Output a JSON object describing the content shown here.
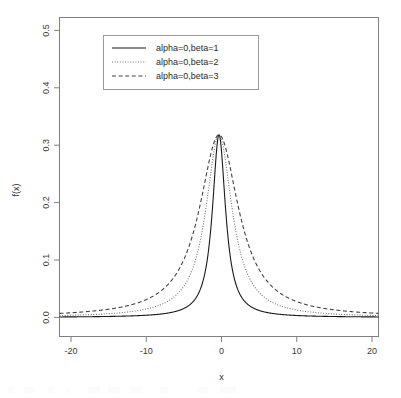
{
  "chart_data": {
    "type": "line",
    "title": "",
    "xlabel": "x",
    "ylabel": "f(x)",
    "xlim": [
      -20,
      20
    ],
    "ylim": [
      0.0,
      0.53
    ],
    "xticks": [
      -20,
      -10,
      0,
      10,
      20
    ],
    "xtick_labels": [
      "-20",
      "-10",
      "0",
      "10",
      "20"
    ],
    "yticks": [
      0.0,
      0.1,
      0.2,
      0.3,
      0.4,
      0.5
    ],
    "ytick_labels": [
      "0.0",
      "0.1",
      "0.2",
      "0.3",
      "0.4",
      "0.5"
    ],
    "grid": false,
    "legend_position": "top-center",
    "peak_value": 0.318,
    "series": [
      {
        "name": "alpha=0,beta=1",
        "alpha": 0,
        "beta": 1,
        "linestyle": "solid",
        "color": "#1a1a1a",
        "x": [
          -20,
          -18,
          -16,
          -14,
          -12,
          -10,
          -9,
          -8,
          -7,
          -6,
          -5,
          -4,
          -3.5,
          -3,
          -2.5,
          -2,
          -1.75,
          -1.5,
          -1.25,
          -1,
          -0.75,
          -0.5,
          -0.25,
          0,
          0.25,
          0.5,
          0.75,
          1,
          1.25,
          1.5,
          1.75,
          2,
          2.5,
          3,
          3.5,
          4,
          5,
          6,
          7,
          8,
          9,
          10,
          12,
          14,
          16,
          18,
          20
        ],
        "y": [
          0.0008,
          0.001,
          0.0012,
          0.0016,
          0.0022,
          0.0032,
          0.0039,
          0.0049,
          0.0064,
          0.0086,
          0.0122,
          0.0187,
          0.024,
          0.0318,
          0.0439,
          0.0637,
          0.078,
          0.0979,
          0.1252,
          0.1592,
          0.2037,
          0.2546,
          0.2995,
          0.3183,
          0.2995,
          0.2546,
          0.2037,
          0.1592,
          0.1252,
          0.0979,
          0.078,
          0.0637,
          0.0439,
          0.0318,
          0.024,
          0.0187,
          0.0122,
          0.0086,
          0.0064,
          0.0049,
          0.0039,
          0.0032,
          0.0022,
          0.0016,
          0.0012,
          0.001,
          0.0008
        ]
      },
      {
        "name": "alpha=0,beta=2",
        "alpha": 0,
        "beta": 2,
        "linestyle": "dotted",
        "color": "#777777",
        "x": [
          -20,
          -18,
          -16,
          -14,
          -12,
          -10,
          -9,
          -8,
          -7,
          -6,
          -5,
          -4,
          -3.5,
          -3,
          -2.5,
          -2,
          -1.5,
          -1,
          -0.75,
          -0.5,
          -0.25,
          0,
          0.25,
          0.5,
          0.75,
          1,
          1.5,
          2,
          2.5,
          3,
          3.5,
          4,
          5,
          6,
          7,
          8,
          9,
          10,
          12,
          14,
          16,
          18,
          20
        ],
        "y": [
          0.003,
          0.0037,
          0.0047,
          0.0061,
          0.0082,
          0.0117,
          0.014,
          0.0171,
          0.0214,
          0.0273,
          0.0357,
          0.0473,
          0.0542,
          0.062,
          0.0704,
          0.079,
          0.0947,
          0.1063,
          0.1093,
          0.1111,
          0.1116,
          0.1117,
          0.1116,
          0.1111,
          0.1093,
          0.1063,
          0.0947,
          0.079,
          0.0704,
          0.062,
          0.0542,
          0.0473,
          0.0357,
          0.0273,
          0.0214,
          0.0171,
          0.014,
          0.0117,
          0.0082,
          0.0061,
          0.0047,
          0.0037,
          0.003
        ]
      },
      {
        "name": "alpha=0,beta=3",
        "alpha": 0,
        "beta": 3,
        "linestyle": "dashed",
        "color": "#444444",
        "x": [
          -20,
          -18,
          -16,
          -14,
          -12,
          -10,
          -9,
          -8,
          -7,
          -6,
          -5,
          -4,
          -3,
          -2,
          -1,
          -0.5,
          0,
          0.5,
          1,
          2,
          3,
          4,
          5,
          6,
          7,
          8,
          9,
          10,
          12,
          14,
          16,
          18,
          20
        ],
        "y": [
          0.0062,
          0.0076,
          0.0095,
          0.0122,
          0.0162,
          0.0226,
          0.0271,
          0.0328,
          0.0403,
          0.05,
          0.0623,
          0.0769,
          0.0919,
          0.104,
          0.1104,
          0.1113,
          0.1114,
          0.1113,
          0.1104,
          0.104,
          0.0919,
          0.0769,
          0.0623,
          0.05,
          0.0403,
          0.0328,
          0.0271,
          0.0226,
          0.0162,
          0.0122,
          0.0095,
          0.0076,
          0.0062
        ]
      }
    ]
  },
  "legend": {
    "entries": [
      {
        "label": "alpha=0,beta=1",
        "style": "solid"
      },
      {
        "label": "alpha=0,beta=2",
        "style": "dotted"
      },
      {
        "label": "alpha=0,beta=3",
        "style": "dashed"
      }
    ]
  },
  "colors": {
    "axis": "#808080",
    "text": "#2b2b2b",
    "background": "#ffffff",
    "series_1": "#1a1a1a",
    "series_2": "#777777",
    "series_3": "#444444"
  }
}
